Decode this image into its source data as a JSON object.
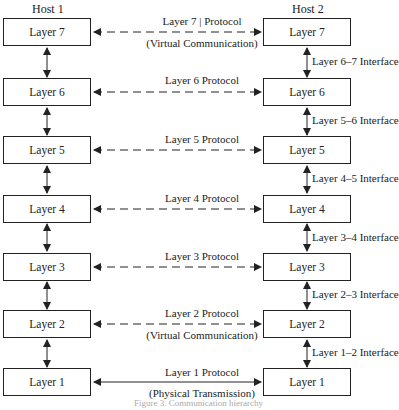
{
  "hosts": {
    "left": "Host 1",
    "right": "Host 2"
  },
  "layers": [
    {
      "name": "Layer 7",
      "protocol": "Layer 7 | Protocol",
      "subtitle": "(Virtual Communication)",
      "interface": "Layer 6–7 Interface"
    },
    {
      "name": "Layer 6",
      "protocol": "Layer 6 Protocol",
      "subtitle": "",
      "interface": "Layer 5–6 Interface"
    },
    {
      "name": "Layer 5",
      "protocol": "Layer 5 Protocol",
      "subtitle": "",
      "interface": "Layer 4–5 Interface"
    },
    {
      "name": "Layer 4",
      "protocol": "Layer 4 Protocol",
      "subtitle": "",
      "interface": "Layer 3–4 Interface"
    },
    {
      "name": "Layer 3",
      "protocol": "Layer 3 Protocol",
      "subtitle": "",
      "interface": "Layer 2–3 Interface"
    },
    {
      "name": "Layer 2",
      "protocol": "Layer 2 Protocol",
      "subtitle": "(Virtual Communication)",
      "interface": "Layer 1–2 Interface"
    },
    {
      "name": "Layer 1",
      "protocol": "Layer 1 Protocol",
      "subtitle": "(Physical Transmission)",
      "interface": ""
    }
  ],
  "caption": "Figure 3.  Communication hierarchy"
}
